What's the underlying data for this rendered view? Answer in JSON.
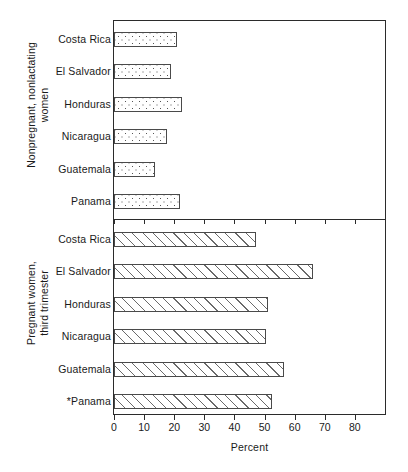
{
  "chart_data": {
    "type": "bar",
    "orientation": "horizontal",
    "title": "",
    "xlabel": "Percent",
    "ylabel": "",
    "xlim": [
      0,
      90
    ],
    "xticks": [
      0,
      10,
      20,
      30,
      40,
      50,
      60,
      70,
      80
    ],
    "xtick_labels": [
      "0",
      "10",
      "20",
      "30",
      "40",
      "50",
      "60",
      "70",
      "80"
    ],
    "grid": false,
    "legend": null,
    "panels": [
      {
        "group_label": "Nonpregnant, nonlactating\nwomen",
        "fill_style": "dotted",
        "categories": [
          "Costa Rica",
          "El Salvador",
          "Honduras",
          "Nicaragua",
          "Guatemala",
          "Panama"
        ],
        "values": [
          21.0,
          19.0,
          22.5,
          17.5,
          13.5,
          22.0
        ]
      },
      {
        "group_label": "Pregnant women,\nthird trimester",
        "fill_style": "hatched",
        "categories": [
          "Costa Rica",
          "El Salvador",
          "Honduras",
          "Nicaragua",
          "Guatemala",
          "*Panama"
        ],
        "values": [
          47.0,
          66.0,
          51.0,
          50.5,
          56.5,
          52.5
        ]
      }
    ],
    "colors": {
      "axis": "#2b2b2b",
      "bar_outline": "#4a4a4a",
      "bar_fill": "#ffffff",
      "pattern": "#5a5a5a",
      "background": "#ffffff"
    }
  }
}
